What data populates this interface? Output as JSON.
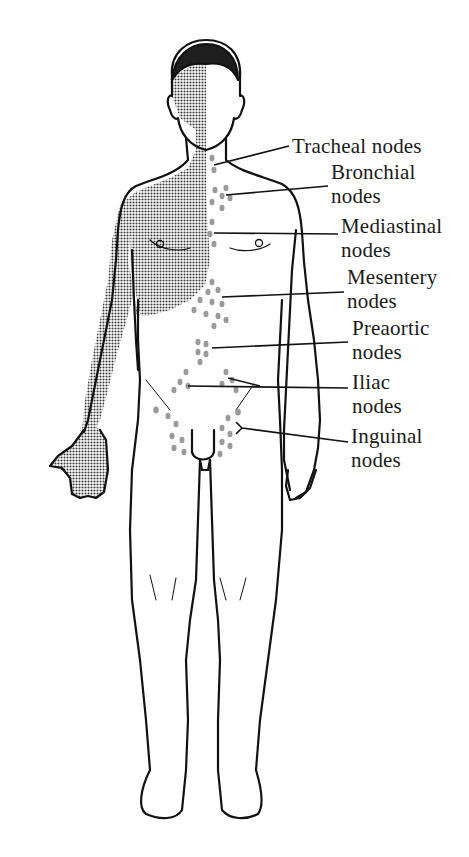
{
  "figure": {
    "colors": {
      "outline": "#111111",
      "shade": "#6e6e6e",
      "node_dots": "#9a9a9a",
      "background": "#ffffff"
    }
  },
  "labels": [
    {
      "id": "tracheal",
      "line1": "Tracheal nodes",
      "line2": ""
    },
    {
      "id": "bronchial",
      "line1": "Bronchial",
      "line2": "nodes"
    },
    {
      "id": "mediastinal",
      "line1": "Mediastinal",
      "line2": "nodes"
    },
    {
      "id": "mesentery",
      "line1": "Mesentery",
      "line2": "nodes"
    },
    {
      "id": "preaortic",
      "line1": "Preaortic",
      "line2": "nodes"
    },
    {
      "id": "iliac",
      "line1": "Iliac",
      "line2": "nodes"
    },
    {
      "id": "inguinal",
      "line1": "Inguinal",
      "line2": "nodes"
    }
  ]
}
